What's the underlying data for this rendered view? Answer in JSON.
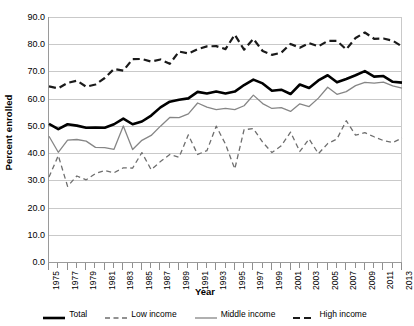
{
  "chart_data": {
    "type": "line",
    "title": "",
    "xlabel": "Year",
    "ylabel": "Percent enrolled",
    "ylim": [
      0,
      90
    ],
    "ytick_step": 10,
    "yticks": [
      "0.0",
      "10.0",
      "20.0",
      "30.0",
      "40.0",
      "50.0",
      "60.0",
      "70.0",
      "80.0",
      "90.0"
    ],
    "grid": true,
    "legend_position": "bottom",
    "x": [
      1975,
      1976,
      1977,
      1978,
      1979,
      1980,
      1981,
      1982,
      1983,
      1984,
      1985,
      1986,
      1987,
      1988,
      1989,
      1990,
      1991,
      1992,
      1993,
      1994,
      1995,
      1996,
      1997,
      1998,
      1999,
      2000,
      2001,
      2002,
      2003,
      2004,
      2005,
      2006,
      2007,
      2008,
      2009,
      2010,
      2011,
      2012,
      2013
    ],
    "xtick_labels": [
      "1975",
      "1977",
      "1979",
      "1981",
      "1983",
      "1985",
      "1987",
      "1989",
      "1991",
      "1993",
      "1995",
      "1997",
      "1999",
      "2001",
      "2003",
      "2005",
      "2007",
      "2009",
      "2011",
      "2013"
    ],
    "series": [
      {
        "name": "Total",
        "style": "solid-thick",
        "color": "#000000",
        "values": [
          50.7,
          48.8,
          50.6,
          50.1,
          49.3,
          49.4,
          49.3,
          50.6,
          52.7,
          50.6,
          51.6,
          53.8,
          56.8,
          58.9,
          59.6,
          60.1,
          62.5,
          61.9,
          62.6,
          61.9,
          62.6,
          65.0,
          67.0,
          65.6,
          62.9,
          63.3,
          61.7,
          65.2,
          63.9,
          66.7,
          68.6,
          66.0,
          67.2,
          68.6,
          70.1,
          68.1,
          68.3,
          66.2,
          65.9
        ],
        "linewidth": 2.6
      },
      {
        "name": "Low income",
        "style": "dashed-thin",
        "color": "#6e6e6e",
        "values": [
          31.2,
          39.1,
          27.8,
          31.6,
          30.2,
          32.5,
          33.6,
          32.8,
          34.6,
          34.5,
          40.2,
          33.9,
          36.9,
          39.5,
          38.5,
          46.7,
          39.5,
          40.9,
          49.9,
          43.3,
          34.2,
          48.6,
          49.0,
          44.0,
          40.2,
          42.7,
          47.7,
          40.6,
          45.2,
          39.8,
          43.5,
          45.2,
          51.9,
          46.6,
          47.5,
          46.0,
          44.6,
          43.9,
          45.5
        ],
        "linewidth": 1.3
      },
      {
        "name": "Middle income",
        "style": "solid-thin",
        "color": "#868686",
        "values": [
          46.2,
          40.3,
          44.8,
          45.0,
          44.4,
          42.1,
          42.0,
          41.4,
          50.0,
          41.3,
          44.7,
          46.5,
          49.9,
          53.1,
          53.0,
          54.4,
          58.4,
          56.9,
          56.0,
          56.4,
          56.0,
          57.4,
          61.3,
          58.2,
          56.4,
          56.7,
          55.3,
          58.1,
          57.1,
          60.2,
          64.2,
          61.6,
          62.6,
          64.8,
          66.0,
          65.7,
          66.1,
          64.7,
          63.9
        ],
        "linewidth": 1.3
      },
      {
        "name": "High income",
        "style": "dashed-thick",
        "color": "#1a1a1a",
        "values": [
          64.5,
          63.8,
          65.8,
          66.6,
          64.4,
          65.2,
          67.6,
          70.9,
          70.3,
          74.5,
          74.6,
          73.6,
          74.4,
          72.8,
          77.3,
          76.6,
          78.2,
          79.2,
          79.3,
          78.2,
          83.5,
          78.0,
          82.0,
          77.5,
          76.1,
          76.9,
          80.1,
          78.7,
          80.4,
          79.2,
          81.2,
          81.2,
          78.1,
          82.3,
          84.3,
          82.0,
          82.1,
          81.3,
          79.2
        ],
        "linewidth": 2.2
      }
    ]
  },
  "axes": {
    "y_title": "Percent enrolled",
    "x_title": "Year"
  },
  "legend": {
    "items": [
      {
        "label": "Total"
      },
      {
        "label": "Low income"
      },
      {
        "label": "Middle income"
      },
      {
        "label": "High income"
      }
    ]
  }
}
